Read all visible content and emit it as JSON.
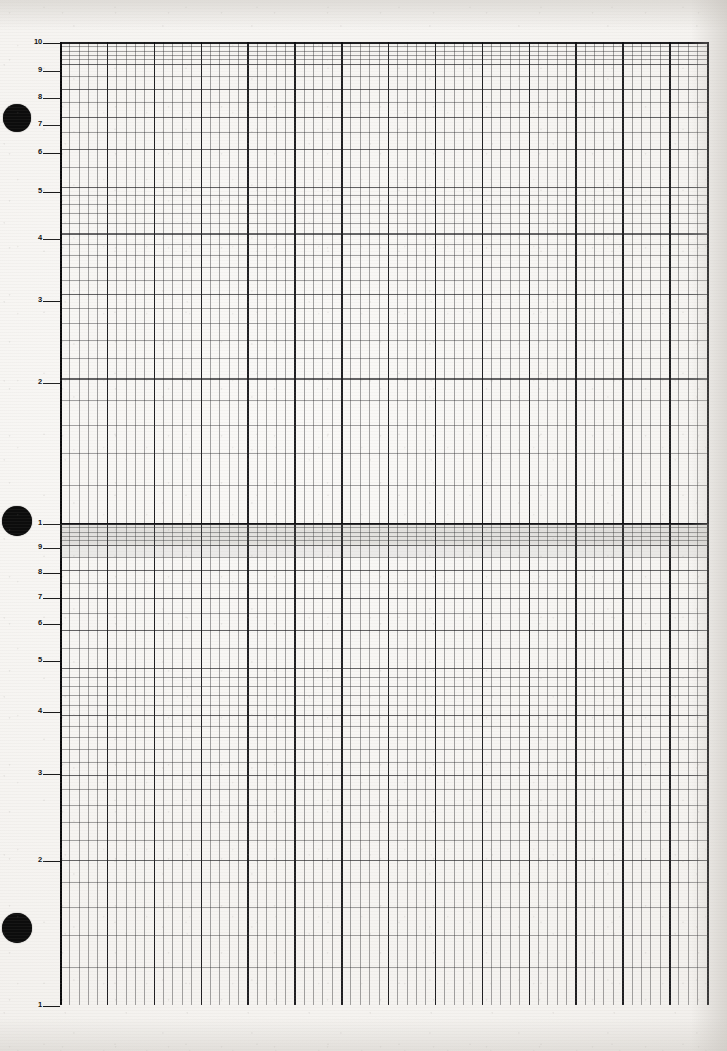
{
  "sheet": {
    "kind": "semi-logarithmic graph paper",
    "cycles": 2,
    "paper_color": "#f5f3f0",
    "grid_ink_color": "#14141a",
    "width_px": 727,
    "height_px": 1051
  },
  "punch_holes": [
    {
      "name": "punch-hole-top",
      "cx": 17,
      "cy": 118,
      "r": 14
    },
    {
      "name": "punch-hole-middle",
      "cx": 17,
      "cy": 521,
      "r": 15
    },
    {
      "name": "punch-hole-bottom",
      "cx": 17,
      "cy": 928,
      "r": 15
    }
  ],
  "plot_area": {
    "left": 60,
    "top": 42,
    "right": 709,
    "bottom": 1005
  },
  "scan_artifacts": {
    "band_top": 524,
    "band_height": 22,
    "band2_top": 546,
    "band2_height": 12
  },
  "chart_data": {
    "type": "grid",
    "title": "",
    "subtitle": "",
    "xlabel": "",
    "ylabel": "",
    "grid": "on",
    "legend": "none",
    "series": [],
    "x_axis": {
      "scale": "linear",
      "minor_spacing_px": 9.37,
      "minor_divisions": 69,
      "major_every": 5,
      "tick_labels": []
    },
    "y_axis": {
      "scale": "log",
      "cycles": 2,
      "range": [
        1,
        100
      ],
      "decade_boundaries_px": [
        42,
        523,
        1005
      ],
      "tick_labels": [
        {
          "text": "10",
          "y": 42,
          "decade": 1,
          "value": 10
        },
        {
          "text": "9",
          "y": 70,
          "decade": 1,
          "value": 9
        },
        {
          "text": "8",
          "y": 97,
          "decade": 1,
          "value": 8
        },
        {
          "text": "7",
          "y": 124,
          "decade": 1,
          "value": 7
        },
        {
          "text": "6",
          "y": 152,
          "decade": 1,
          "value": 6
        },
        {
          "text": "5",
          "y": 191,
          "decade": 1,
          "value": 5
        },
        {
          "text": "4",
          "y": 238,
          "decade": 1,
          "value": 4
        },
        {
          "text": "3",
          "y": 300,
          "decade": 1,
          "value": 3
        },
        {
          "text": "2",
          "y": 382,
          "decade": 1,
          "value": 2
        },
        {
          "text": "1",
          "y": 523,
          "decade": 1,
          "value": 1
        },
        {
          "text": "9",
          "y": 547,
          "decade": 2,
          "value": 0.9
        },
        {
          "text": "8",
          "y": 572,
          "decade": 2,
          "value": 0.8
        },
        {
          "text": "7",
          "y": 597,
          "decade": 2,
          "value": 0.7
        },
        {
          "text": "6",
          "y": 623,
          "decade": 2,
          "value": 0.6
        },
        {
          "text": "5",
          "y": 660,
          "decade": 2,
          "value": 0.5
        },
        {
          "text": "4",
          "y": 711,
          "decade": 2,
          "value": 0.4
        },
        {
          "text": "3",
          "y": 773,
          "decade": 2,
          "value": 0.3
        },
        {
          "text": "2",
          "y": 860,
          "decade": 2,
          "value": 0.2
        },
        {
          "text": "1",
          "y": 1005,
          "decade": 2,
          "value": 0.1
        }
      ]
    }
  }
}
